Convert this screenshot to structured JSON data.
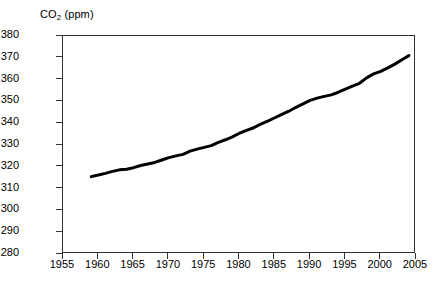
{
  "chart_data": {
    "type": "line",
    "title": "CO2 (ppm)",
    "title_prefix": "CO",
    "title_subscript": "2",
    "title_suffix": " (ppm)",
    "xlabel": "",
    "ylabel": "",
    "xlim": [
      1955,
      2005
    ],
    "ylim": [
      280,
      380
    ],
    "grid": false,
    "legend": "none",
    "line_color": "#000000",
    "line_width_px": 3,
    "axis_color": "#333333",
    "background_color": "#ffffff",
    "xticks": [
      1955,
      1960,
      1965,
      1970,
      1975,
      1980,
      1985,
      1990,
      1995,
      2000,
      2005
    ],
    "xtick_labels": [
      "1955",
      "1960",
      "1965",
      "1970",
      "1975",
      "1980",
      "1985",
      "1990",
      "1995",
      "2000",
      "2005"
    ],
    "yticks": [
      280,
      290,
      300,
      310,
      320,
      330,
      340,
      350,
      360,
      370,
      380
    ],
    "ytick_labels": [
      "280",
      "290",
      "300",
      "310",
      "320",
      "330",
      "340",
      "350",
      "360",
      "370",
      "380"
    ],
    "series": [
      {
        "name": "Atmospheric CO2 concentration",
        "x": [
          1959,
          1960,
          1961,
          1962,
          1963,
          1964,
          1965,
          1966,
          1967,
          1968,
          1969,
          1970,
          1971,
          1972,
          1973,
          1974,
          1975,
          1976,
          1977,
          1978,
          1979,
          1980,
          1981,
          1982,
          1983,
          1984,
          1985,
          1986,
          1987,
          1988,
          1989,
          1990,
          1991,
          1992,
          1993,
          1994,
          1995,
          1996,
          1997,
          1998,
          1999,
          2000,
          2001,
          2002,
          2003,
          2004
        ],
        "values": [
          315.5,
          316.2,
          317.0,
          317.9,
          318.6,
          318.9,
          319.6,
          320.6,
          321.3,
          322.0,
          323.1,
          324.2,
          325.0,
          325.7,
          327.2,
          328.1,
          328.9,
          329.7,
          331.2,
          332.4,
          333.7,
          335.4,
          336.7,
          337.9,
          339.6,
          341.0,
          342.5,
          344.0,
          345.5,
          347.3,
          348.9,
          350.5,
          351.5,
          352.3,
          353.0,
          354.2,
          355.6,
          357.0,
          358.3,
          360.8,
          362.6,
          363.8,
          365.4,
          367.1,
          369.1,
          371.0
        ]
      }
    ]
  },
  "axes": {
    "y_axis_name": "co2-concentration-axis",
    "x_axis_name": "year-axis"
  }
}
